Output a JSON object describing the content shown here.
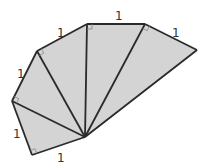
{
  "diagram": {
    "type": "spiral-of-right-triangles",
    "fill_color": "#d4d4d4",
    "stroke_color": "#2a2a2a",
    "center": [
      85,
      137
    ],
    "outer_vertices": [
      [
        32,
        155
      ],
      [
        12,
        101
      ],
      [
        37,
        51
      ],
      [
        87,
        24
      ],
      [
        145,
        24
      ],
      [
        197,
        50
      ]
    ],
    "triangle_count": 5,
    "leg_labels": [
      {
        "text": "1",
        "x": 57,
        "y": 152
      },
      {
        "text": "1",
        "x": 13,
        "y": 128
      },
      {
        "text": "1",
        "x": 17,
        "y": 68
      },
      {
        "text": "1",
        "x": 57,
        "y": 27
      },
      {
        "text": "1",
        "x": 115,
        "y": 10
      },
      {
        "text": "1",
        "x": 172,
        "y": 27
      }
    ],
    "right_angle_marks": [
      {
        "vertex": [
          32,
          155
        ]
      },
      {
        "vertex": [
          12,
          101
        ]
      },
      {
        "vertex": [
          37,
          51
        ]
      },
      {
        "vertex": [
          87,
          24
        ]
      },
      {
        "vertex": [
          145,
          24
        ]
      }
    ]
  }
}
